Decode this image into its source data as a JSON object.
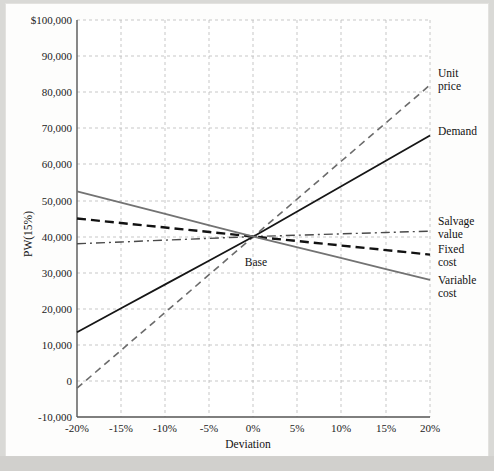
{
  "chart_data": {
    "type": "line",
    "title": "",
    "xlabel": "Deviation",
    "ylabel": "PW(15%)",
    "xlim": [
      -20,
      20
    ],
    "ylim": [
      -10000,
      100000
    ],
    "grid": true,
    "legend_position": "right-inline",
    "x": [
      -20,
      -15,
      -10,
      -5,
      0,
      5,
      10,
      15,
      20
    ],
    "xtick_labels": [
      "-20%",
      "-15%",
      "-10%",
      "-5%",
      "0%",
      "5%",
      "10%",
      "15%",
      "20%"
    ],
    "ytick_values": [
      -10000,
      0,
      10000,
      20000,
      30000,
      40000,
      50000,
      60000,
      70000,
      80000,
      90000,
      100000
    ],
    "ytick_labels": [
      "-10,000",
      "0",
      "10,000",
      "20,000",
      "30,000",
      "40,000",
      "50,000",
      "60,000",
      "70,000",
      "80,000",
      "90,000",
      "$100,000"
    ],
    "annotations": [
      {
        "text": "Base",
        "x": 0,
        "y": 40000
      }
    ],
    "series": [
      {
        "name": "Unit price",
        "label": "Unit\nprice",
        "label_line1": "Unit",
        "label_line2": "price",
        "style": "dashed",
        "color": "#6b6b6b",
        "width": 1.6,
        "values": [
          -2000,
          8500,
          19000,
          29500,
          40000,
          50500,
          61000,
          71500,
          82000
        ]
      },
      {
        "name": "Demand",
        "label": "Demand",
        "label_line1": "Demand",
        "label_line2": "",
        "style": "solid",
        "color": "#161616",
        "width": 1.8,
        "values": [
          13500,
          20125,
          26750,
          33375,
          40000,
          47000,
          54000,
          61000,
          68000
        ]
      },
      {
        "name": "Salvage value",
        "label": "Salvage\nvalue",
        "label_line1": "Salvage",
        "label_line2": "value",
        "style": "dashdot",
        "color": "#4a4a4a",
        "width": 1.4,
        "values": [
          38000,
          38500,
          39000,
          39500,
          40000,
          40375,
          40750,
          41125,
          41500
        ]
      },
      {
        "name": "Fixed cost",
        "label": "Fixed\ncost",
        "label_line1": "Fixed",
        "label_line2": "cost",
        "style": "dashed-bold",
        "color": "#121212",
        "width": 2.4,
        "values": [
          45000,
          43750,
          42500,
          41250,
          40000,
          38750,
          37500,
          36250,
          35000
        ]
      },
      {
        "name": "Variable cost",
        "label": "Variable\ncost",
        "label_line1": "Variable",
        "label_line2": "cost",
        "style": "solid",
        "color": "#737373",
        "width": 1.8,
        "values": [
          52500,
          49375,
          46250,
          43125,
          40000,
          37000,
          34000,
          31000,
          28000
        ]
      }
    ]
  }
}
